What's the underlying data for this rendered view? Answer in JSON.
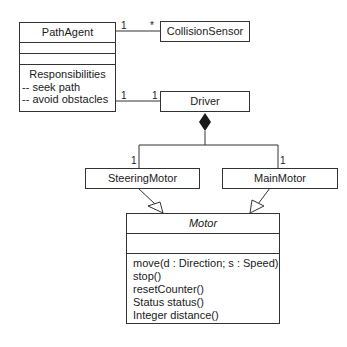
{
  "classes": {
    "path_agent": {
      "name": "PathAgent",
      "responsibilities_title": "Responsibilities",
      "responsibilities": [
        "-- seek path",
        "-- avoid obstacles"
      ]
    },
    "collision_sensor": {
      "name": "CollisionSensor"
    },
    "driver": {
      "name": "Driver"
    },
    "steering_motor": {
      "name": "SteeringMotor"
    },
    "main_motor": {
      "name": "MainMotor"
    },
    "motor": {
      "name": "Motor",
      "abstract": true,
      "operations": [
        "move(d : Direction; s : Speed)",
        "stop()",
        "resetCounter()",
        "Status status()",
        "Integer distance()"
      ]
    }
  },
  "associations": {
    "pathagent_collisionsensor": {
      "source_mult": "1",
      "target_mult": "*"
    },
    "pathagent_driver": {
      "source_mult": "1",
      "target_mult": "1"
    },
    "driver_steeringmotor": {
      "type": "composition",
      "target_mult": "1"
    },
    "driver_mainmotor": {
      "type": "composition",
      "target_mult": "1"
    }
  },
  "generalizations": [
    {
      "child": "SteeringMotor",
      "parent": "Motor"
    },
    {
      "child": "MainMotor",
      "parent": "Motor"
    }
  ]
}
